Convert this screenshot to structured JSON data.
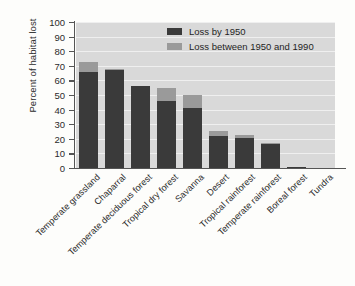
{
  "chart_data": {
    "type": "bar",
    "subtype": "stacked-vertical",
    "title": "",
    "xlabel": "",
    "ylabel": "Percent of habitat lost",
    "ylim": [
      0,
      100
    ],
    "ytick_step": 10,
    "yticks": [
      0,
      10,
      20,
      30,
      40,
      50,
      60,
      70,
      80,
      90,
      100
    ],
    "grid": true,
    "grid_axis": "y",
    "legend_position": "top-right-inside",
    "categories": [
      "Temperate grassland",
      "Chaparral",
      "Temperate deciduous forest",
      "Tropical dry forest",
      "Savanna",
      "Desert",
      "Tropical rainforest",
      "Temperate rainforest",
      "Boreal forest",
      "Tundra"
    ],
    "series": [
      {
        "name": "Loss by 1950",
        "color": "#3a3a3a",
        "values": [
          66,
          67,
          56,
          46,
          41,
          22,
          20.5,
          16.5,
          1,
          0
        ]
      },
      {
        "name": "Loss between 1950 and 1990",
        "color": "#9a9a9a",
        "values": [
          6.5,
          0.5,
          0,
          9,
          9,
          3.5,
          2,
          0.5,
          0,
          0
        ]
      }
    ],
    "totals": [
      72.5,
      67.5,
      56,
      55,
      50,
      25.5,
      22.5,
      17,
      1,
      0
    ]
  },
  "legend": {
    "items": [
      {
        "label": "Loss by 1950",
        "color": "#3a3a3a"
      },
      {
        "label": "Loss between 1950 and 1990",
        "color": "#9a9a9a"
      }
    ]
  },
  "axes": {
    "y_title": "Percent of habitat lost",
    "y_ticklabels": [
      "100",
      "90",
      "80",
      "70",
      "60",
      "50",
      "40",
      "30",
      "20",
      "10",
      "0"
    ]
  },
  "colors": {
    "plot_background": "#d9d9d9",
    "page_background": "#fdfdfb",
    "gridline": "#efefef",
    "axis": "#555555",
    "early_loss": "#3a3a3a",
    "late_loss": "#9a9a9a",
    "text": "#2b2b2b"
  }
}
